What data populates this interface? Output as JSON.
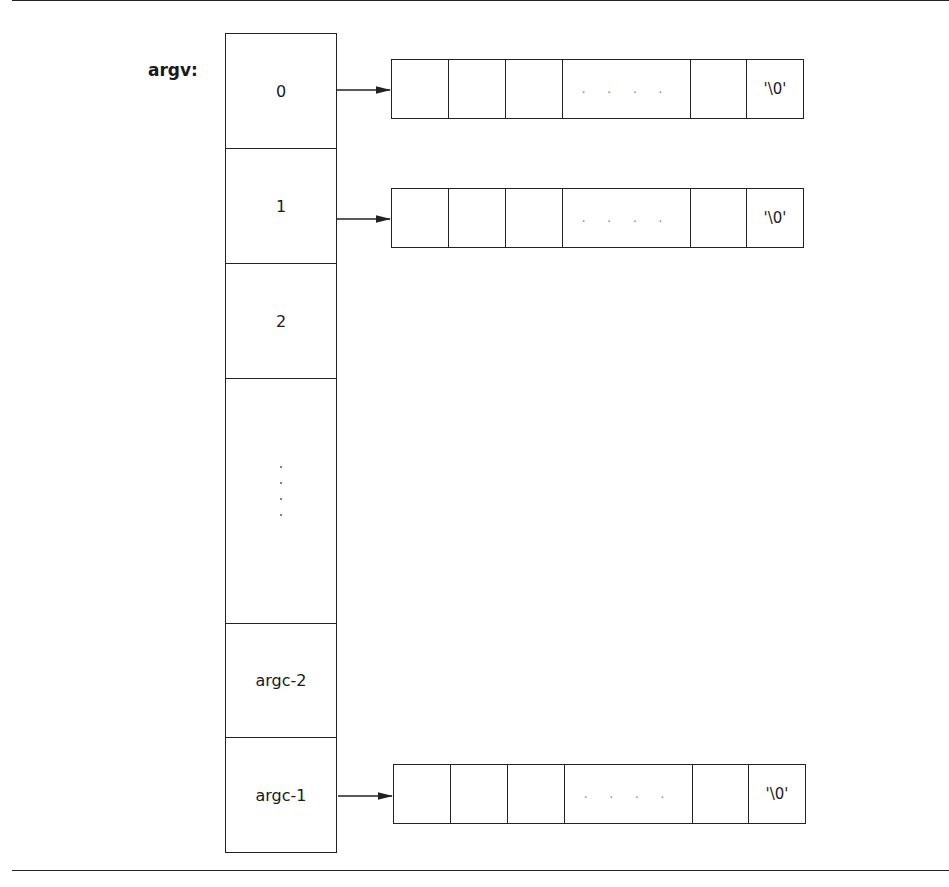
{
  "diagram": {
    "label": "argv:",
    "array_cells": [
      {
        "label": "0",
        "has_pointer": true
      },
      {
        "label": "1",
        "has_pointer": true
      },
      {
        "label": "2",
        "has_pointer": false
      },
      {
        "label": "",
        "ellipsis": true,
        "has_pointer": false
      },
      {
        "label": "argc-2",
        "has_pointer": false
      },
      {
        "label": "argc-1",
        "has_pointer": true
      }
    ],
    "string_strip": {
      "cells": [
        "",
        "",
        "",
        "....",
        "",
        "'\\0'"
      ],
      "terminator": "'\\0'",
      "ellipsis": ". . . ."
    }
  }
}
